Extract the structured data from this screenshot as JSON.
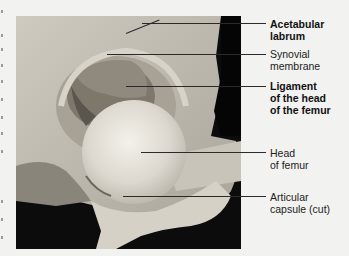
{
  "figure": {
    "type": "anatomical-photograph",
    "labels": [
      {
        "id": "acetabular-labrum",
        "lines": [
          "Acetabular",
          "labrum"
        ],
        "bold": true
      },
      {
        "id": "synovial-membrane",
        "lines": [
          "Synovial",
          "membrane"
        ],
        "bold": false
      },
      {
        "id": "ligament-head-femur",
        "lines": [
          "Ligament",
          "of the head",
          "of the femur"
        ],
        "bold": true
      },
      {
        "id": "head-of-femur",
        "lines": [
          "Head",
          "of femur"
        ],
        "bold": false
      },
      {
        "id": "articular-capsule",
        "lines": [
          "Articular",
          "capsule (cut)"
        ],
        "bold": false
      }
    ]
  }
}
